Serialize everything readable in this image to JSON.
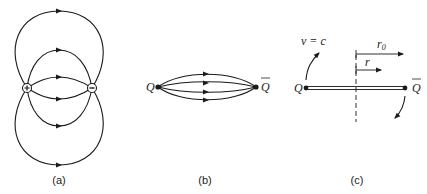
{
  "panels": [
    {
      "id": "a",
      "caption": "(a)",
      "description": "Dipole field lines between positive and negative charges",
      "charges": [
        {
          "sign": "+",
          "symbol": "+"
        },
        {
          "sign": "-",
          "symbol": "−"
        }
      ]
    },
    {
      "id": "b",
      "caption": "(b)",
      "description": "Color flux tube between quark and antiquark",
      "left_label": "Q",
      "right_label": "Q",
      "right_label_bar": true
    },
    {
      "id": "c",
      "caption": "(c)",
      "description": "Rotating string with ends moving at speed of light",
      "left_label": "Q",
      "right_label": "Q",
      "right_label_bar": true,
      "velocity_label": "v = c",
      "radius_outer_label": "r",
      "radius_outer_subscript": "0",
      "radius_inner_label": "r"
    }
  ],
  "colors": {
    "line": "#1a1a1a",
    "background": "#ffffff"
  }
}
